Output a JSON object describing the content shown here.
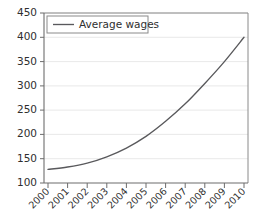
{
  "chart_data": {
    "type": "line",
    "title": "",
    "xlabel": "",
    "ylabel": "",
    "x": [
      2000,
      2001,
      2002,
      2003,
      2004,
      2005,
      2006,
      2007,
      2008,
      2009,
      2010
    ],
    "categories": [
      "2000",
      "2001",
      "2002",
      "2003",
      "2004",
      "2005",
      "2006",
      "2007",
      "2008",
      "2009",
      "2010"
    ],
    "series": [
      {
        "name": "Average wages",
        "color": "#59595c",
        "values": [
          128,
          133,
          141,
          154,
          172,
          196,
          227,
          263,
          305,
          350,
          400
        ]
      }
    ],
    "ylim": [
      100,
      450
    ],
    "yticks": [
      100,
      150,
      200,
      250,
      300,
      350,
      400,
      450
    ],
    "ytick_labels": [
      "100",
      "150",
      "200",
      "250",
      "300",
      "350",
      "400",
      "450"
    ],
    "xticks": [
      2000,
      2001,
      2002,
      2003,
      2004,
      2005,
      2006,
      2007,
      2008,
      2009,
      2010
    ],
    "xtick_labels": [
      "2000",
      "2001",
      "2002",
      "2003",
      "2004",
      "2005",
      "2006",
      "2007",
      "2008",
      "2009",
      "2010"
    ],
    "xtick_rotation": 45,
    "grid": true,
    "grid_axis": "y",
    "legend": {
      "position": "top-left",
      "entries": [
        {
          "label": "Average wages",
          "color": "#59595c"
        }
      ]
    },
    "colors": {
      "series": "#59595c",
      "axis": "#6d6d6d",
      "grid": "#e2e2e2",
      "text": "#2f2f2f",
      "background": "#ffffff"
    }
  }
}
